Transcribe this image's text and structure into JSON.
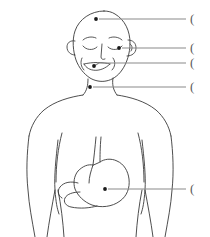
{
  "diagram": {
    "view": "anterior",
    "line_color": "#3a3a3a",
    "leader_color": "#8a8a8a",
    "marker_color": "#1a1a1a",
    "background_color": "#ffffff"
  },
  "figure": {
    "parts": [
      {
        "name": "head",
        "label": "head"
      },
      {
        "name": "left-ear",
        "label": "ear"
      },
      {
        "name": "right-ear",
        "label": "ear"
      },
      {
        "name": "eyebrows",
        "label": "eyebrows"
      },
      {
        "name": "closed-eyes",
        "label": "closed eyes"
      },
      {
        "name": "nose",
        "label": "nose"
      },
      {
        "name": "mouth",
        "label": "open smiling mouth"
      },
      {
        "name": "neck",
        "label": "neck"
      },
      {
        "name": "shoulders",
        "label": "shoulders"
      },
      {
        "name": "left-arm",
        "label": "left arm"
      },
      {
        "name": "right-arm",
        "label": "right arm"
      },
      {
        "name": "torso",
        "label": "torso"
      },
      {
        "name": "esophagus",
        "label": "esophagus"
      },
      {
        "name": "stomach",
        "label": "stomach"
      },
      {
        "name": "duodenum",
        "label": "duodenum"
      }
    ]
  },
  "callouts": [
    {
      "id": "callout-head",
      "target": "head",
      "marker": {
        "x": 96,
        "y": 19
      },
      "line": {
        "x1": 99,
        "y1": 19,
        "x2": 186,
        "y2": 19
      },
      "bracket": "(",
      "bracket_x": 190,
      "bracket_y": 23,
      "label": ""
    },
    {
      "id": "callout-ear",
      "target": "ear",
      "marker": {
        "x": 119,
        "y": 48
      },
      "line": {
        "x1": 122,
        "y1": 48,
        "x2": 186,
        "y2": 48
      },
      "bracket": "(",
      "bracket_x": 190,
      "bracket_y": 52,
      "label": ""
    },
    {
      "id": "callout-mouth",
      "target": "mouth",
      "marker": {
        "x": 94,
        "y": 66
      },
      "line": {
        "x1": 97,
        "y1": 63,
        "x2": 186,
        "y2": 63
      },
      "bracket": "(",
      "bracket_x": 190,
      "bracket_y": 67,
      "label": ""
    },
    {
      "id": "callout-throat",
      "target": "neck",
      "marker": {
        "x": 90,
        "y": 87
      },
      "line": {
        "x1": 93,
        "y1": 87,
        "x2": 186,
        "y2": 87
      },
      "bracket": "(",
      "bracket_x": 190,
      "bracket_y": 91,
      "label": ""
    },
    {
      "id": "callout-stomach",
      "target": "stomach",
      "marker": {
        "x": 105,
        "y": 189
      },
      "line": {
        "x1": 108,
        "y1": 189,
        "x2": 186,
        "y2": 189
      },
      "bracket": "(",
      "bracket_x": 190,
      "bracket_y": 193,
      "label": ""
    }
  ]
}
